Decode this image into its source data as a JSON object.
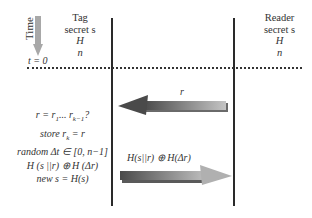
{
  "diagram": {
    "time_axis": {
      "label": "Time",
      "start_label": "t = 0"
    },
    "tag": {
      "title": "Tag",
      "lines": [
        "secret s",
        "H",
        "n"
      ]
    },
    "reader": {
      "title": "Reader",
      "lines": [
        "secret s",
        "H",
        "n"
      ]
    },
    "messages": [
      {
        "from": "reader",
        "to": "tag",
        "label": "r"
      },
      {
        "from": "tag",
        "to": "reader",
        "label": "H(s||r) ⊕ H(Δr)"
      }
    ],
    "tag_steps": [
      "r = r1... rk−1?",
      "store rk = r",
      "random Δt ∈ [0, n−1]",
      "H (s ||r) ⊕ H (Δr)",
      "new s = H(s)"
    ],
    "colors": {
      "lifeline": "#2a2a2a",
      "time_arrow": "#a8a8a8",
      "arrow_dark": "#555555",
      "arrow_light": "#b8b8b8"
    }
  }
}
